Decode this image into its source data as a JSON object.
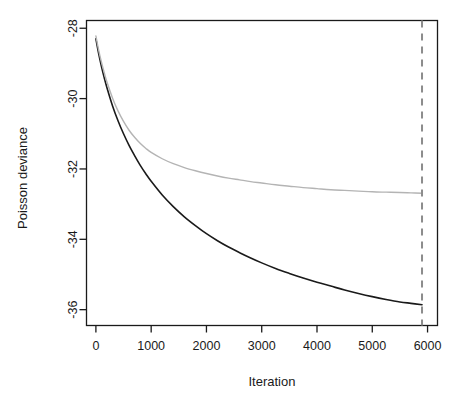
{
  "chart_data": {
    "type": "line",
    "title": "",
    "subtitle": "",
    "xlabel": "Iteration",
    "ylabel": "Poisson deviance",
    "xlim": [
      -170,
      6180
    ],
    "ylim": [
      -36.45,
      -27.78
    ],
    "xticks": [
      0,
      1000,
      2000,
      3000,
      4000,
      5000,
      6000
    ],
    "xtick_labels": [
      "0",
      "1000",
      "2000",
      "3000",
      "4000",
      "5000",
      "6000"
    ],
    "yticks": [
      -28,
      -30,
      -32,
      -34,
      -36
    ],
    "ytick_labels": [
      "-28",
      "-30",
      "-32",
      "-34",
      "-36"
    ],
    "grid": false,
    "legend": "none",
    "box": true,
    "series": [
      {
        "name": "training-deviance",
        "color": "#1a1a1a",
        "linewidth": 1.6,
        "linestyle": "solid",
        "x": [
          0,
          50,
          100,
          150,
          200,
          300,
          400,
          500,
          600,
          700,
          800,
          900,
          1000,
          1200,
          1400,
          1600,
          1800,
          2000,
          2200,
          2400,
          2600,
          2800,
          3000,
          3250,
          3500,
          3750,
          4000,
          4250,
          4500,
          4750,
          5000,
          5250,
          5500,
          5700,
          5900
        ],
        "y": [
          -28.3,
          -28.72,
          -29.08,
          -29.4,
          -29.69,
          -30.2,
          -30.63,
          -31.0,
          -31.33,
          -31.62,
          -31.89,
          -32.13,
          -32.35,
          -32.74,
          -33.07,
          -33.36,
          -33.61,
          -33.84,
          -34.04,
          -34.22,
          -34.38,
          -34.53,
          -34.67,
          -34.83,
          -34.97,
          -35.1,
          -35.22,
          -35.33,
          -35.44,
          -35.54,
          -35.63,
          -35.71,
          -35.78,
          -35.82,
          -35.86
        ]
      },
      {
        "name": "cv-deviance",
        "color": "#b4b4b4",
        "linewidth": 1.4,
        "linestyle": "solid",
        "x": [
          0,
          50,
          100,
          150,
          200,
          300,
          400,
          500,
          600,
          700,
          800,
          900,
          1000,
          1200,
          1400,
          1600,
          1800,
          2000,
          2200,
          2400,
          2600,
          2800,
          3000,
          3250,
          3500,
          3750,
          4000,
          4250,
          4500,
          4750,
          5000,
          5250,
          5500,
          5700,
          5900
        ],
        "y": [
          -28.22,
          -28.62,
          -28.96,
          -29.26,
          -29.53,
          -29.98,
          -30.35,
          -30.65,
          -30.9,
          -31.1,
          -31.27,
          -31.41,
          -31.53,
          -31.71,
          -31.85,
          -31.96,
          -32.05,
          -32.13,
          -32.2,
          -32.26,
          -32.31,
          -32.36,
          -32.4,
          -32.45,
          -32.49,
          -32.53,
          -32.56,
          -32.59,
          -32.61,
          -32.63,
          -32.65,
          -32.66,
          -32.67,
          -32.68,
          -32.69
        ]
      }
    ],
    "annotations": [
      {
        "name": "best-iteration-marker",
        "type": "vline",
        "x": 5900,
        "color": "#8c8c8c",
        "linestyle": "dashed",
        "linewidth": 2.0,
        "label": ""
      }
    ]
  }
}
